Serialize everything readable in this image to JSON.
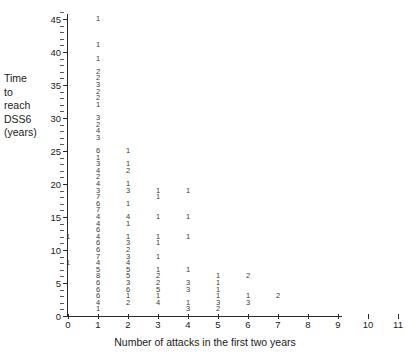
{
  "chart_data": {
    "type": "scatter",
    "title": "",
    "xlabel": "Number of attacks in the first two years",
    "ylabel": "Time to reach DSS6 (years)",
    "ylabel_lines": [
      "Time",
      "to",
      "reach",
      "DSS6",
      "(years)"
    ],
    "xlim": [
      0,
      11
    ],
    "ylim": [
      0,
      46
    ],
    "grid": false,
    "legend": null,
    "xticks": [
      0,
      1,
      2,
      3,
      4,
      5,
      6,
      7,
      8,
      9,
      10,
      11
    ],
    "xtick_labels": [
      "0",
      "1",
      "2",
      "3",
      "4",
      "5",
      "6",
      "7",
      "8",
      "9",
      "10",
      "11"
    ],
    "yticks": [
      0,
      5,
      10,
      15,
      20,
      25,
      30,
      35,
      40,
      45
    ],
    "ytick_labels": [
      "0",
      "5",
      "10",
      "15",
      "20",
      "25",
      "30",
      "35",
      "40",
      "45"
    ],
    "ytick_minor_step": 1,
    "points": [
      {
        "x": 0,
        "y": 12,
        "count": "1"
      },
      {
        "x": 0,
        "y": 8,
        "count": "1"
      },
      {
        "x": 1,
        "y": 45,
        "count": "1"
      },
      {
        "x": 1,
        "y": 41,
        "count": "1"
      },
      {
        "x": 1,
        "y": 39,
        "count": "1"
      },
      {
        "x": 1,
        "y": 37,
        "count": "2"
      },
      {
        "x": 1,
        "y": 36,
        "count": "2"
      },
      {
        "x": 1,
        "y": 35,
        "count": "3"
      },
      {
        "x": 1,
        "y": 34,
        "count": "2"
      },
      {
        "x": 1,
        "y": 33,
        "count": "2"
      },
      {
        "x": 1,
        "y": 32,
        "count": "1"
      },
      {
        "x": 1,
        "y": 30,
        "count": "3"
      },
      {
        "x": 1,
        "y": 29,
        "count": "2"
      },
      {
        "x": 1,
        "y": 28,
        "count": "4"
      },
      {
        "x": 1,
        "y": 27,
        "count": "3"
      },
      {
        "x": 1,
        "y": 25,
        "count": "6"
      },
      {
        "x": 1,
        "y": 24,
        "count": "1"
      },
      {
        "x": 1,
        "y": 23,
        "count": "3"
      },
      {
        "x": 1,
        "y": 22,
        "count": "4"
      },
      {
        "x": 1,
        "y": 21,
        "count": "2"
      },
      {
        "x": 1,
        "y": 20,
        "count": "4"
      },
      {
        "x": 1,
        "y": 19,
        "count": "3"
      },
      {
        "x": 1,
        "y": 18,
        "count": "7"
      },
      {
        "x": 1,
        "y": 17,
        "count": "6"
      },
      {
        "x": 1,
        "y": 16,
        "count": "7"
      },
      {
        "x": 1,
        "y": 15,
        "count": "4"
      },
      {
        "x": 1,
        "y": 14,
        "count": "4"
      },
      {
        "x": 1,
        "y": 13,
        "count": "6"
      },
      {
        "x": 1,
        "y": 12,
        "count": "4"
      },
      {
        "x": 1,
        "y": 11,
        "count": "6"
      },
      {
        "x": 1,
        "y": 10,
        "count": "6"
      },
      {
        "x": 1,
        "y": 9,
        "count": "7"
      },
      {
        "x": 1,
        "y": 8,
        "count": "4"
      },
      {
        "x": 1,
        "y": 7,
        "count": "5"
      },
      {
        "x": 1,
        "y": 6,
        "count": "8"
      },
      {
        "x": 1,
        "y": 5,
        "count": "6"
      },
      {
        "x": 1,
        "y": 4,
        "count": "6"
      },
      {
        "x": 1,
        "y": 3,
        "count": "6"
      },
      {
        "x": 1,
        "y": 2,
        "count": "4"
      },
      {
        "x": 1,
        "y": 1,
        "count": "1"
      },
      {
        "x": 2,
        "y": 25,
        "count": "1"
      },
      {
        "x": 2,
        "y": 23,
        "count": "1"
      },
      {
        "x": 2,
        "y": 22,
        "count": "2"
      },
      {
        "x": 2,
        "y": 20,
        "count": "1"
      },
      {
        "x": 2,
        "y": 19,
        "count": "3"
      },
      {
        "x": 2,
        "y": 17,
        "count": "1"
      },
      {
        "x": 2,
        "y": 15,
        "count": "4"
      },
      {
        "x": 2,
        "y": 14,
        "count": "1"
      },
      {
        "x": 2,
        "y": 12,
        "count": "1"
      },
      {
        "x": 2,
        "y": 11,
        "count": "3"
      },
      {
        "x": 2,
        "y": 10,
        "count": "2"
      },
      {
        "x": 2,
        "y": 9,
        "count": "3"
      },
      {
        "x": 2,
        "y": 8,
        "count": "4"
      },
      {
        "x": 2,
        "y": 7,
        "count": "5"
      },
      {
        "x": 2,
        "y": 6,
        "count": "5"
      },
      {
        "x": 2,
        "y": 5,
        "count": "3"
      },
      {
        "x": 2,
        "y": 4,
        "count": "6"
      },
      {
        "x": 2,
        "y": 3,
        "count": "1"
      },
      {
        "x": 2,
        "y": 2,
        "count": "2"
      },
      {
        "x": 3,
        "y": 19,
        "count": "1"
      },
      {
        "x": 3,
        "y": 18,
        "count": "1"
      },
      {
        "x": 3,
        "y": 15,
        "count": "1"
      },
      {
        "x": 3,
        "y": 12,
        "count": "1"
      },
      {
        "x": 3,
        "y": 11,
        "count": "1"
      },
      {
        "x": 3,
        "y": 9,
        "count": "1"
      },
      {
        "x": 3,
        "y": 7,
        "count": "1"
      },
      {
        "x": 3,
        "y": 6,
        "count": "2"
      },
      {
        "x": 3,
        "y": 5,
        "count": "2"
      },
      {
        "x": 3,
        "y": 4,
        "count": "5"
      },
      {
        "x": 3,
        "y": 3,
        "count": "1"
      },
      {
        "x": 3,
        "y": 2,
        "count": "4"
      },
      {
        "x": 4,
        "y": 19,
        "count": "1"
      },
      {
        "x": 4,
        "y": 15,
        "count": "1"
      },
      {
        "x": 4,
        "y": 12,
        "count": "1"
      },
      {
        "x": 4,
        "y": 7,
        "count": "1"
      },
      {
        "x": 4,
        "y": 5,
        "count": "3"
      },
      {
        "x": 4,
        "y": 4,
        "count": "3"
      },
      {
        "x": 4,
        "y": 2,
        "count": "1"
      },
      {
        "x": 4,
        "y": 1,
        "count": "3"
      },
      {
        "x": 5,
        "y": 6,
        "count": "1"
      },
      {
        "x": 5,
        "y": 5,
        "count": "1"
      },
      {
        "x": 5,
        "y": 4,
        "count": "1"
      },
      {
        "x": 5,
        "y": 3,
        "count": "1"
      },
      {
        "x": 5,
        "y": 2,
        "count": "3"
      },
      {
        "x": 5,
        "y": 1,
        "count": "2"
      },
      {
        "x": 6,
        "y": 6,
        "count": "2"
      },
      {
        "x": 6,
        "y": 3,
        "count": "1"
      },
      {
        "x": 6,
        "y": 2,
        "count": "3"
      },
      {
        "x": 7,
        "y": 3,
        "count": "2"
      }
    ]
  }
}
